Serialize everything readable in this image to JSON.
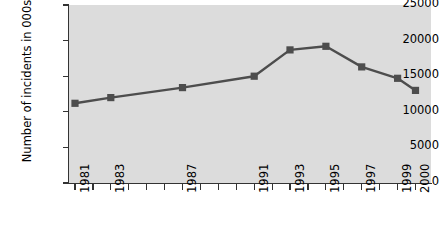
{
  "chart_data": {
    "type": "line",
    "title": "",
    "xlabel": "",
    "ylabel": "Number of incidents in 000s",
    "ylim": [
      0,
      25000
    ],
    "ytick_labels": [
      "0",
      "5000",
      "10000",
      "15000",
      "20000",
      "25000"
    ],
    "ytick_values": [
      0,
      5000,
      10000,
      15000,
      20000,
      25000
    ],
    "grid": false,
    "legend": "none",
    "x_axis_years": [
      1981,
      1982,
      1983,
      1984,
      1985,
      1986,
      1987,
      1988,
      1989,
      1990,
      1991,
      1992,
      1993,
      1994,
      1995,
      1996,
      1997,
      1998,
      1999,
      2000
    ],
    "x_tick_labels": [
      "1981",
      "",
      "1983",
      "",
      "",
      "",
      "1987",
      "",
      "",
      "",
      "1991",
      "",
      "1993",
      "",
      "1995",
      "",
      "1997",
      "",
      "1999",
      "2000"
    ],
    "categories": [
      "1981",
      "1983",
      "1987",
      "1991",
      "1993",
      "1995",
      "1997",
      "1999",
      "2000"
    ],
    "values": [
      11200,
      12000,
      13400,
      15000,
      18700,
      19200,
      16300,
      14700,
      13000
    ],
    "marker": "square",
    "series_color": "#4d4d4d",
    "plot_background": "#dcdcdc",
    "axis_color": "#333333"
  },
  "axis": {
    "y_title": "Number of incidents in 000s"
  }
}
